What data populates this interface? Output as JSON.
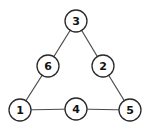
{
  "diagram": {
    "type": "graph",
    "nodes": [
      {
        "id": "n3",
        "label": "3",
        "x": 76,
        "y": 21
      },
      {
        "id": "n6",
        "label": "6",
        "x": 48,
        "y": 66
      },
      {
        "id": "n2",
        "label": "2",
        "x": 103,
        "y": 66
      },
      {
        "id": "n1",
        "label": "1",
        "x": 20,
        "y": 110
      },
      {
        "id": "n4",
        "label": "4",
        "x": 76,
        "y": 109
      },
      {
        "id": "n5",
        "label": "5",
        "x": 130,
        "y": 110
      }
    ],
    "edges": [
      {
        "from": "3",
        "to": "6"
      },
      {
        "from": "3",
        "to": "2"
      },
      {
        "from": "6",
        "to": "1"
      },
      {
        "from": "2",
        "to": "5"
      },
      {
        "from": "1",
        "to": "4"
      },
      {
        "from": "4",
        "to": "5"
      }
    ]
  }
}
